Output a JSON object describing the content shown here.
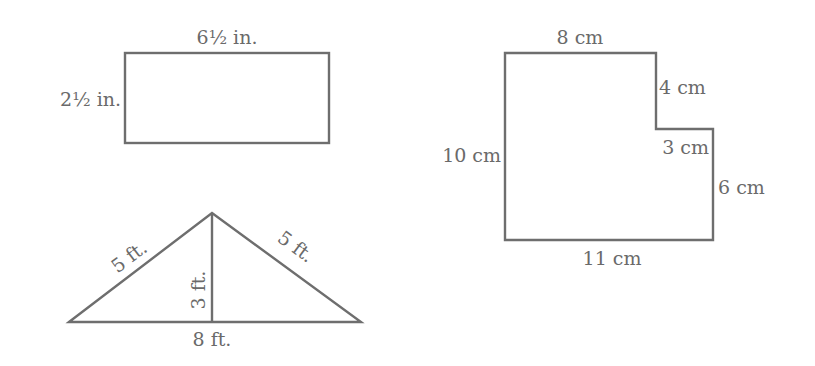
{
  "figures": {
    "rectangle": {
      "top_label": "6½ in.",
      "left_label": "2½ in."
    },
    "l_shape": {
      "top_label": "8 cm",
      "notch_vertical_label": "4 cm",
      "notch_horizontal_label": "3 cm",
      "right_label": "6 cm",
      "left_label": "10 cm",
      "bottom_label": "11 cm"
    },
    "triangle": {
      "left_side_label": "5 ft.",
      "right_side_label": "5 ft.",
      "height_label": "3 ft.",
      "base_label": "8 ft."
    }
  },
  "colors": {
    "stroke": "#6e6e6e",
    "text": "#6a6a6a",
    "background": "#ffffff"
  }
}
